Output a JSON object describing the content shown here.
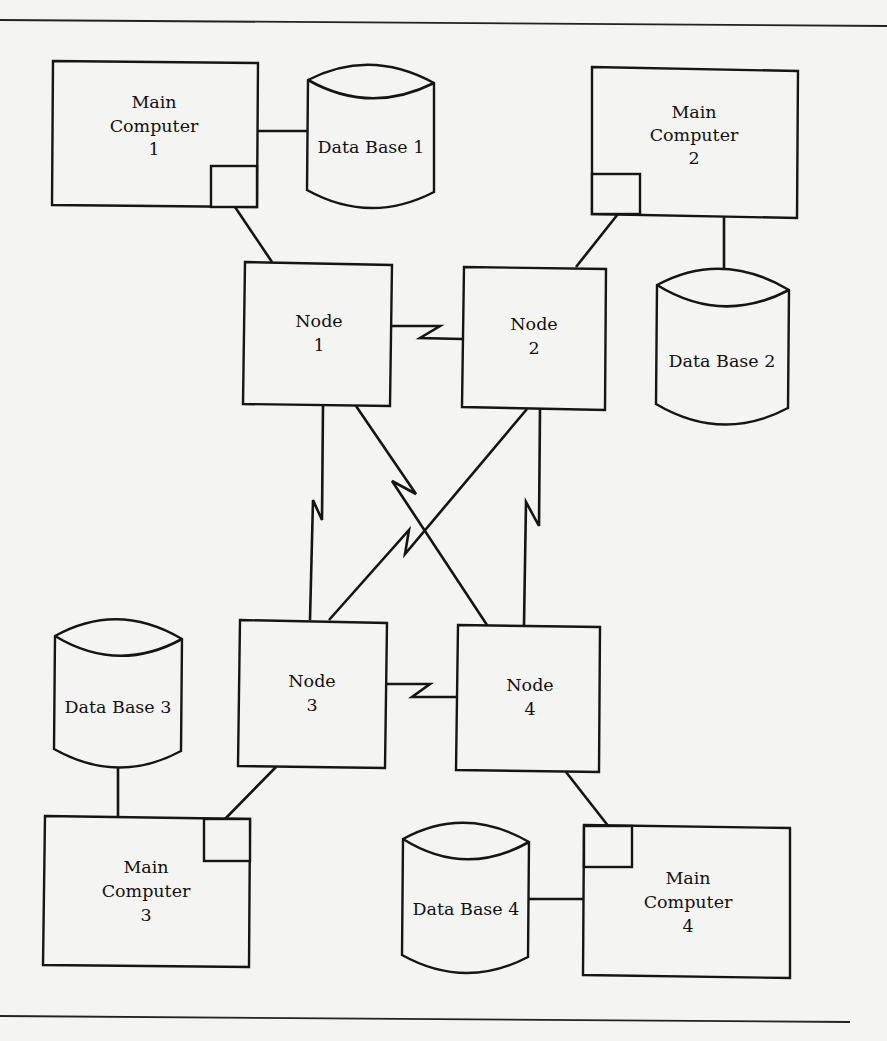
{
  "diagram": {
    "title": "",
    "main_computers": [
      {
        "id": "mc1",
        "line1": "Main",
        "line2": "Computer",
        "line3": "1"
      },
      {
        "id": "mc2",
        "line1": "Main",
        "line2": "Computer",
        "line3": "2"
      },
      {
        "id": "mc3",
        "line1": "Main",
        "line2": "Computer",
        "line3": "3"
      },
      {
        "id": "mc4",
        "line1": "Main",
        "line2": "Computer",
        "line3": "4"
      }
    ],
    "nodes": [
      {
        "id": "n1",
        "line1": "Node",
        "line2": "1"
      },
      {
        "id": "n2",
        "line1": "Node",
        "line2": "2"
      },
      {
        "id": "n3",
        "line1": "Node",
        "line2": "3"
      },
      {
        "id": "n4",
        "line1": "Node",
        "line2": "4"
      }
    ],
    "databases": [
      {
        "id": "db1",
        "label": "Data Base 1"
      },
      {
        "id": "db2",
        "label": "Data Base 2"
      },
      {
        "id": "db3",
        "label": "Data Base 3"
      },
      {
        "id": "db4",
        "label": "Data Base 4"
      }
    ],
    "connections": [
      {
        "from": "Main Computer 1",
        "to": "Data Base 1",
        "type": "direct"
      },
      {
        "from": "Main Computer 1",
        "to": "Node 1",
        "type": "direct"
      },
      {
        "from": "Main Computer 2",
        "to": "Data Base 2",
        "type": "direct"
      },
      {
        "from": "Main Computer 2",
        "to": "Node 2",
        "type": "direct"
      },
      {
        "from": "Main Computer 3",
        "to": "Data Base 3",
        "type": "direct"
      },
      {
        "from": "Main Computer 3",
        "to": "Node 3",
        "type": "direct"
      },
      {
        "from": "Main Computer 4",
        "to": "Data Base 4",
        "type": "direct"
      },
      {
        "from": "Main Computer 4",
        "to": "Node 4",
        "type": "direct"
      },
      {
        "from": "Node 1",
        "to": "Node 2",
        "type": "communication-link"
      },
      {
        "from": "Node 3",
        "to": "Node 4",
        "type": "communication-link"
      },
      {
        "from": "Node 1",
        "to": "Node 3",
        "type": "communication-link"
      },
      {
        "from": "Node 2",
        "to": "Node 4",
        "type": "communication-link"
      },
      {
        "from": "Node 1",
        "to": "Node 4",
        "type": "communication-link"
      },
      {
        "from": "Node 2",
        "to": "Node 3",
        "type": "communication-link"
      }
    ]
  }
}
